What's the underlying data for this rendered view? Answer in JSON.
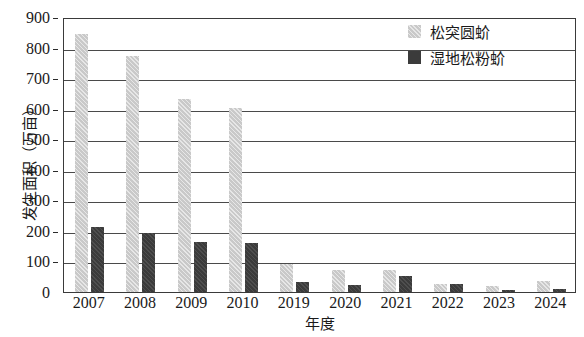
{
  "chart_data": {
    "type": "bar",
    "title": "",
    "xlabel": "年度",
    "ylabel": "发生面积（万亩）",
    "ylim": [
      0,
      900
    ],
    "ytick_step": 100,
    "yticks": [
      0,
      100,
      200,
      300,
      400,
      500,
      600,
      700,
      800,
      900
    ],
    "ytick_labels": [
      "0",
      "100",
      "200",
      "300",
      "400",
      "500",
      "600",
      "700",
      "800",
      "900"
    ],
    "grid": true,
    "grid_axis": "y",
    "legend_position": "top-right",
    "categories": [
      "2007",
      "2008",
      "2009",
      "2010",
      "2019",
      "2020",
      "2021",
      "2022",
      "2023",
      "2024"
    ],
    "series": [
      {
        "name": "松突圆蚧",
        "color": "#c9c9c9",
        "values": [
          845,
          772,
          632,
          603,
          93,
          72,
          72,
          25,
          20,
          35
        ]
      },
      {
        "name": "湿地松粉蚧",
        "color": "#3b3b3b",
        "values": [
          212,
          192,
          165,
          160,
          33,
          22,
          52,
          25,
          8,
          10
        ]
      }
    ]
  },
  "legend": {
    "items": [
      {
        "label": "松突圆蚧",
        "swatch": "light-gray-square"
      },
      {
        "label": "湿地松粉蚧",
        "swatch": "dark-gray-square"
      }
    ]
  },
  "axes": {
    "y_title": "发生面积（万亩）",
    "x_title": "年度"
  }
}
